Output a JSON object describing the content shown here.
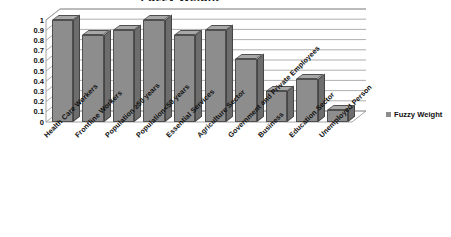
{
  "chart_data": {
    "type": "bar",
    "title": "Fuzzy Weight",
    "xlabel": "",
    "ylabel": "",
    "ylim": [
      0,
      1
    ],
    "grid": true,
    "legend_position": "right",
    "three_d": true,
    "categories": [
      "Health Care Workers",
      "Frontline Workers",
      "Population ≥50 years",
      "Population<50 years",
      "Essential Services",
      "Agriculture  Sector",
      "Government and Private Employees",
      "Business",
      "Education Sector",
      "Unemployed Person"
    ],
    "series": [
      {
        "name": "Fuzzy Weight",
        "values": [
          1,
          0.85,
          0.9,
          1,
          0.85,
          0.9,
          0.62,
          0.3,
          0.42,
          0.12
        ]
      }
    ],
    "ytick_labels": [
      "1",
      "0.9",
      "0.8",
      "0.7",
      "0.6",
      "0.5",
      "0.4",
      "0.3",
      "0.2",
      "0.1",
      "0"
    ],
    "ytick_values": [
      1,
      0.9,
      0.8,
      0.7,
      0.6,
      0.5,
      0.4,
      0.3,
      0.2,
      0.1,
      0
    ]
  },
  "legend": {
    "entries": [
      {
        "label": "Fuzzy Weight",
        "color": "#8d8d8d"
      }
    ]
  },
  "colors": {
    "bar_face": "#8d8d8d",
    "bar_side": "#6d6d6d",
    "bar_top": "#a8a8a8",
    "outline": "#4f4f4f",
    "grid": "#9a9a9a",
    "text": "#111111",
    "background": "#ffffff"
  }
}
